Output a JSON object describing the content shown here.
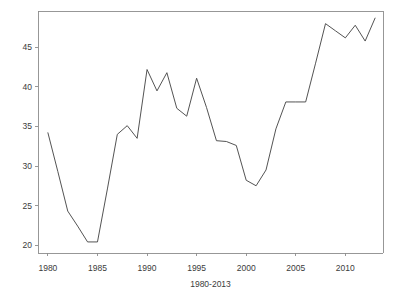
{
  "chart_data": {
    "type": "line",
    "title": "",
    "xlabel": "1980-2013",
    "ylabel": "",
    "xlim": [
      1979.0,
      2013.8
    ],
    "ylim": [
      19.0,
      49.6
    ],
    "grid": false,
    "legend": null,
    "x_ticks": [
      1980,
      1985,
      1990,
      1995,
      2000,
      2005,
      2010
    ],
    "x_tick_labels": [
      "1980",
      "1985",
      "1990",
      "1995",
      "2000",
      "2005",
      "2010"
    ],
    "y_ticks": [
      20,
      25,
      30,
      35,
      40,
      45
    ],
    "y_tick_labels": [
      "20",
      "25",
      "30",
      "35",
      "40",
      "45"
    ],
    "line_color": "#4a4a4a",
    "axis_color": "#8c8c8c",
    "background_color": "#ffffff",
    "x": [
      1980,
      1981,
      1982,
      1983,
      1984,
      1985,
      1986,
      1987,
      1988,
      1989,
      1990,
      1991,
      1992,
      1993,
      1994,
      1995,
      1996,
      1997,
      1998,
      1999,
      2000,
      2001,
      2002,
      2003,
      2004,
      2005,
      2006,
      2007,
      2008,
      2009,
      2010,
      2011,
      2012,
      2013
    ],
    "values": [
      34.2,
      29.3,
      24.3,
      22.4,
      20.4,
      20.4,
      27.1,
      34.0,
      35.1,
      33.5,
      42.2,
      39.5,
      41.8,
      37.3,
      36.3,
      41.1,
      37.4,
      33.2,
      33.1,
      32.6,
      28.2,
      27.5,
      29.5,
      34.7,
      38.1,
      38.1,
      38.1,
      43.0,
      48.0,
      47.1,
      46.2,
      47.8,
      45.8,
      48.7
    ],
    "series": [
      {
        "name": "series-1",
        "values": [
          34.2,
          29.3,
          24.3,
          22.4,
          20.4,
          20.4,
          27.1,
          34.0,
          35.1,
          33.5,
          42.2,
          39.5,
          41.8,
          37.3,
          36.3,
          41.1,
          37.4,
          33.2,
          33.1,
          32.6,
          28.2,
          27.5,
          29.5,
          34.7,
          38.1,
          38.1,
          38.1,
          43.0,
          48.0,
          47.1,
          46.2,
          47.8,
          45.8,
          48.7
        ]
      }
    ]
  },
  "plot_geometry": {
    "left": 38,
    "right": 383,
    "top": 11,
    "bottom": 253,
    "tick_length": 3,
    "x_label_y": 271,
    "axis_title_y": 287
  }
}
